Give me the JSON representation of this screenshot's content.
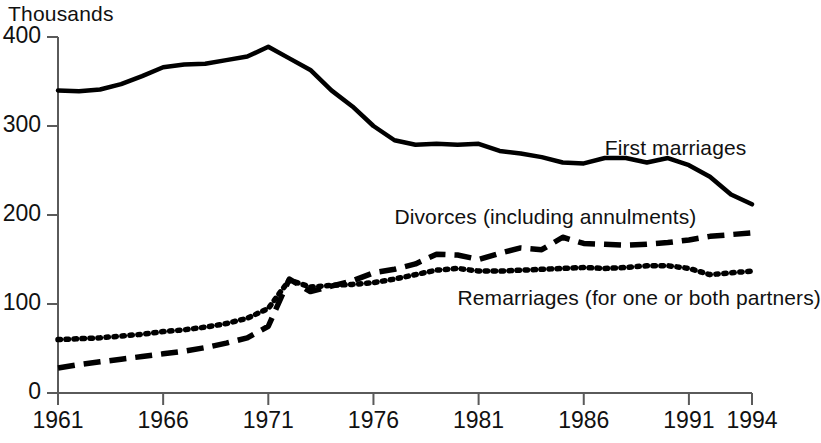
{
  "chart_data": {
    "type": "line",
    "title": "",
    "subtitle": "",
    "unit_label": "Thousands",
    "xlabel": "",
    "ylabel": "",
    "grid": false,
    "legend_position": "inline-annotations",
    "xlim": [
      1961,
      1994
    ],
    "ylim": [
      0,
      400
    ],
    "ytick_labels": [
      "400",
      "300",
      "200",
      "100",
      "0"
    ],
    "ytick_values": [
      400,
      300,
      200,
      100,
      0
    ],
    "xtick_labels": [
      "1961",
      "1966",
      "1971",
      "1976",
      "1981",
      "1986",
      "1991",
      "1994"
    ],
    "xtick_values": [
      1961,
      1966,
      1971,
      1976,
      1981,
      1986,
      1991,
      1994
    ],
    "x": [
      1961,
      1962,
      1963,
      1964,
      1965,
      1966,
      1967,
      1968,
      1969,
      1970,
      1971,
      1972,
      1973,
      1974,
      1975,
      1976,
      1977,
      1978,
      1979,
      1980,
      1981,
      1982,
      1983,
      1984,
      1985,
      1986,
      1987,
      1988,
      1989,
      1990,
      1991,
      1992,
      1993,
      1994
    ],
    "series": [
      {
        "name": "First marriages",
        "style": "solid",
        "color": "#000000",
        "values": [
          340,
          339,
          341,
          347,
          356,
          366,
          369,
          370,
          374,
          378,
          389,
          376,
          363,
          340,
          322,
          300,
          284,
          279,
          280,
          279,
          280,
          272,
          269,
          265,
          259,
          258,
          264,
          264,
          259,
          264,
          256,
          243,
          223,
          212
        ]
      },
      {
        "name": "Divorces (including annulments)",
        "style": "dashed",
        "color": "#000000",
        "values": [
          28,
          32,
          35,
          38,
          41,
          44,
          47,
          51,
          56,
          62,
          75,
          128,
          114,
          120,
          126,
          135,
          139,
          145,
          156,
          155,
          150,
          157,
          163,
          161,
          175,
          168,
          167,
          166,
          167,
          169,
          172,
          176,
          178,
          180
        ]
      },
      {
        "name": "Remarriages (for one or both partners)",
        "style": "dotted",
        "color": "#000000",
        "values": [
          60,
          61,
          62,
          64,
          66,
          69,
          71,
          74,
          78,
          84,
          95,
          127,
          119,
          121,
          122,
          124,
          128,
          133,
          138,
          140,
          137,
          137,
          138,
          139,
          140,
          141,
          140,
          141,
          143,
          143,
          140,
          133,
          135,
          137
        ]
      }
    ],
    "annotations": [
      {
        "text": "First marriages",
        "x": 1987,
        "y": 273,
        "anchor": "left"
      },
      {
        "text": "Divorces (including annulments)",
        "x": 1977,
        "y": 196,
        "anchor": "left"
      },
      {
        "text": "Remarriages (for one or both partners)",
        "x": 1980,
        "y": 105,
        "anchor": "left"
      }
    ]
  },
  "colors": {
    "background": "#ffffff",
    "ink": "#111111",
    "axis": "#5a5a5a",
    "line": "#000000"
  }
}
